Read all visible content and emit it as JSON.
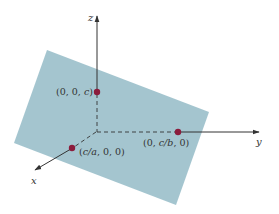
{
  "diagram": {
    "type": "3d-plane-intercepts",
    "plane": {
      "fill": "#9fc2cc",
      "polygon": [
        [
          47,
          50
        ],
        [
          209,
          112
        ],
        [
          176,
          205
        ],
        [
          14,
          143
        ]
      ]
    },
    "axes": {
      "color": "#333333",
      "origin": [
        96,
        132
      ],
      "z": {
        "label": "z",
        "tip": [
          97,
          15
        ],
        "label_pos": [
          88,
          21
        ]
      },
      "y": {
        "label": "y",
        "tip": [
          260,
          132
        ],
        "label_pos": [
          256,
          144
        ]
      },
      "x": {
        "label": "x",
        "tip": [
          34,
          171
        ],
        "label_pos": [
          31,
          183
        ]
      }
    },
    "points": {
      "color": "#8b1c3c",
      "z_intercept": {
        "pos": [
          97,
          92
        ],
        "label_pre": "(0, 0, ",
        "label_var": "c",
        "label_post": ")"
      },
      "y_intercept": {
        "pos": [
          178,
          132
        ],
        "label_pre": "(0, ",
        "label_var": "c/b",
        "label_post": ", 0)"
      },
      "x_intercept": {
        "pos": [
          72,
          148
        ],
        "label_pre": "(",
        "label_var": "c/a",
        "label_post": ", 0, 0)"
      }
    }
  }
}
